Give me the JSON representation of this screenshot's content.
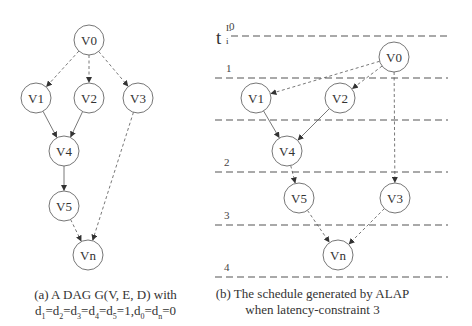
{
  "panel_a": {
    "nodes": [
      {
        "id": "V0",
        "label": "V0",
        "x": 89,
        "y": 40
      },
      {
        "id": "V1",
        "label": "V1",
        "x": 36,
        "y": 98
      },
      {
        "id": "V2",
        "label": "V2",
        "x": 89,
        "y": 98
      },
      {
        "id": "V3",
        "label": "V3",
        "x": 138,
        "y": 98
      },
      {
        "id": "V4",
        "label": "V4",
        "x": 64,
        "y": 151
      },
      {
        "id": "V5",
        "label": "V5",
        "x": 64,
        "y": 206
      },
      {
        "id": "Vn",
        "label": "Vn",
        "x": 88,
        "y": 255
      }
    ],
    "edges": [
      {
        "from": "V0",
        "to": "V1",
        "style": "dashed"
      },
      {
        "from": "V0",
        "to": "V2",
        "style": "dashed"
      },
      {
        "from": "V0",
        "to": "V3",
        "style": "dashed"
      },
      {
        "from": "V1",
        "to": "V4",
        "style": "solid"
      },
      {
        "from": "V2",
        "to": "V4",
        "style": "solid"
      },
      {
        "from": "V4",
        "to": "V5",
        "style": "solid"
      },
      {
        "from": "V5",
        "to": "Vn",
        "style": "dashed"
      },
      {
        "from": "V3",
        "to": "Vn",
        "style": "dashed"
      }
    ],
    "caption_line1": "(a) A DAG G(V, E, D) with",
    "caption_line2_parts": [
      "d",
      "1",
      "=d",
      "2",
      "=d",
      "3",
      "=d",
      "4",
      "=d",
      "5",
      "=1,d",
      "0",
      "=d",
      "n",
      "=0"
    ]
  },
  "panel_b": {
    "axis_label": "t",
    "axis_sup": "L",
    "axis_sub": "i",
    "levels": [
      {
        "label": "0",
        "y": 36
      },
      {
        "label": "1",
        "y": 78
      },
      {
        "label": "",
        "y": 120
      },
      {
        "label": "2",
        "y": 172
      },
      {
        "label": "3",
        "y": 225
      },
      {
        "label": "4",
        "y": 277
      }
    ],
    "nodes": [
      {
        "id": "V0",
        "label": "V0",
        "x": 394,
        "y": 57
      },
      {
        "id": "V1",
        "label": "V1",
        "x": 256,
        "y": 98
      },
      {
        "id": "V2",
        "label": "V2",
        "x": 340,
        "y": 98
      },
      {
        "id": "V4",
        "label": "V4",
        "x": 287,
        "y": 151
      },
      {
        "id": "V5",
        "label": "V5",
        "x": 299,
        "y": 198
      },
      {
        "id": "V3",
        "label": "V3",
        "x": 395,
        "y": 198
      },
      {
        "id": "Vn",
        "label": "Vn",
        "x": 338,
        "y": 255
      }
    ],
    "edges": [
      {
        "from": "V0",
        "to": "V1",
        "style": "dashed"
      },
      {
        "from": "V0",
        "to": "V2",
        "style": "dashed"
      },
      {
        "from": "V0",
        "to": "V3",
        "style": "dashed"
      },
      {
        "from": "V1",
        "to": "V4",
        "style": "solid"
      },
      {
        "from": "V2",
        "to": "V4",
        "style": "solid"
      },
      {
        "from": "V4",
        "to": "V5",
        "style": "dashed"
      },
      {
        "from": "V5",
        "to": "Vn",
        "style": "dashed"
      },
      {
        "from": "V3",
        "to": "Vn",
        "style": "dashed"
      }
    ],
    "caption_line1": "(b) The schedule generated by ALAP",
    "caption_line2": "when latency-constraint 3"
  }
}
